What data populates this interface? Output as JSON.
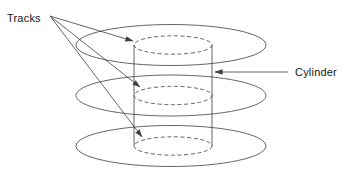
{
  "diagram": {
    "kind": "disk-cylinder-illustration",
    "labels": {
      "tracks": "Tracks",
      "cylinder": "Cylinder"
    },
    "colors": {
      "line": "#3d3d3d",
      "text": "#161616",
      "background": "#ffffff"
    },
    "canvas": {
      "width": 344,
      "height": 179
    },
    "platters": [
      {
        "name": "platter-top",
        "cx": 171,
        "cy": 45,
        "rx": 95,
        "ry": 20.5
      },
      {
        "name": "platter-middle",
        "cx": 171,
        "cy": 95.5,
        "rx": 95,
        "ry": 20.5
      },
      {
        "name": "platter-bottom",
        "cx": 171,
        "cy": 146,
        "rx": 95,
        "ry": 20.5
      }
    ],
    "tracks": [
      {
        "name": "track-top",
        "cx": 173,
        "cy": 45,
        "rx": 39,
        "ry": 9.2
      },
      {
        "name": "track-middle",
        "cx": 173,
        "cy": 95.5,
        "rx": 39,
        "ry": 9.2
      },
      {
        "name": "track-bottom",
        "cx": 173,
        "cy": 146,
        "rx": 39,
        "ry": 9.2
      }
    ],
    "cylinder_walls": [
      {
        "name": "cylinder-wall-left",
        "x1": 134,
        "y1": 45,
        "x2": 134,
        "y2": 146
      },
      {
        "name": "cylinder-wall-right",
        "x1": 212,
        "y1": 45,
        "x2": 212,
        "y2": 146
      }
    ],
    "leaders": [
      {
        "name": "leader-tracks-top",
        "x1": 50,
        "y1": 16,
        "x2": 133,
        "y2": 41
      },
      {
        "name": "leader-tracks-middle",
        "x1": 50,
        "y1": 16,
        "x2": 140,
        "y2": 87
      },
      {
        "name": "leader-tracks-bottom",
        "x1": 50,
        "y1": 16,
        "x2": 142,
        "y2": 137
      },
      {
        "name": "leader-cylinder",
        "x1": 288,
        "y1": 72,
        "x2": 215,
        "y2": 72
      }
    ],
    "label_positions": {
      "tracks": {
        "x": 7,
        "y": 22
      },
      "cylinder": {
        "x": 295,
        "y": 76
      }
    }
  }
}
